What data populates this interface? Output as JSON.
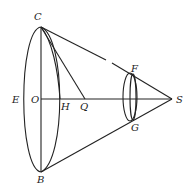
{
  "diagram": {
    "type": "geometric cone figure",
    "labels": {
      "C": "C",
      "E": "E",
      "O": "O",
      "H": "H",
      "Q": "Q",
      "B": "B",
      "F": "F",
      "G": "G",
      "S": "S",
      "P": "P"
    },
    "points": {
      "C": [
        41,
        27
      ],
      "B": [
        41,
        172
      ],
      "O": [
        41,
        99
      ],
      "H": [
        60,
        99
      ],
      "Q": [
        85,
        99
      ],
      "S": [
        172,
        99
      ],
      "F": [
        131,
        73
      ],
      "G": [
        131,
        121
      ]
    },
    "stroke_color": "#222222"
  }
}
